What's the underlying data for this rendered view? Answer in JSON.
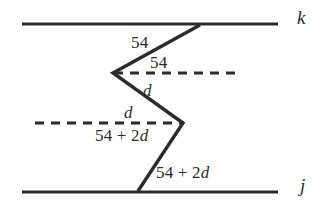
{
  "figure": {
    "background_color": "#ffffff",
    "stroke_color": "#2b2b2b",
    "lines": {
      "parallel_top": {
        "label": "k",
        "y": 24,
        "x_start": 22,
        "x_end": 278
      },
      "parallel_bottom": {
        "label": "j",
        "y": 192,
        "x_start": 22,
        "x_end": 278
      },
      "dashed_upper": {
        "y": 73,
        "x_start": 114,
        "x_end": 241
      },
      "dashed_lower": {
        "y": 123,
        "x_start": 35,
        "x_end": 184
      }
    },
    "zigzag_points": [
      {
        "x": 200,
        "y": 25
      },
      {
        "x": 113,
        "y": 73
      },
      {
        "x": 183,
        "y": 123
      },
      {
        "x": 138,
        "y": 191
      }
    ]
  },
  "labels": {
    "angle_top_upper": {
      "text": "54",
      "x": 131,
      "y": 34
    },
    "angle_top_lower": {
      "text": "54",
      "x": 150,
      "y": 54
    },
    "angle_mid_upper": {
      "text": "d",
      "x": 143,
      "y": 82
    },
    "angle_mid_lower": {
      "text": "d",
      "x": 124,
      "y": 104
    },
    "angle_bottom_upper": {
      "prefix": "54 + 2",
      "var": "d",
      "x": 95,
      "y": 127
    },
    "angle_bottom_lower": {
      "prefix": "54 + 2",
      "var": "d",
      "x": 156,
      "y": 164
    },
    "line_k": {
      "text": "k",
      "x": 297,
      "y": 8
    },
    "line_j": {
      "text": "j",
      "x": 300,
      "y": 176
    }
  }
}
